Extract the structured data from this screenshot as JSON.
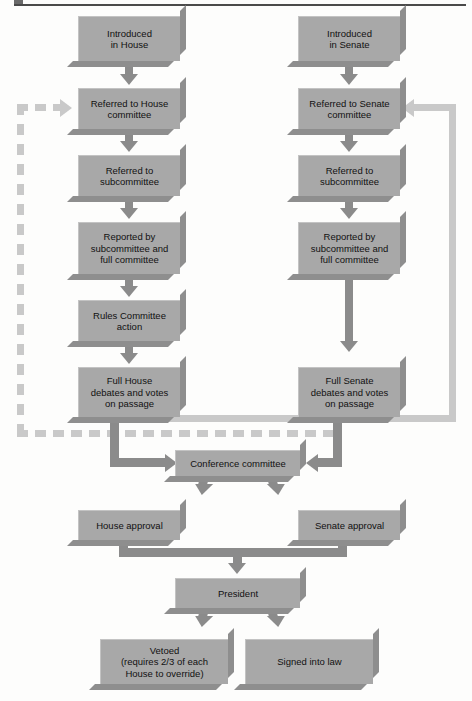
{
  "diagram": {
    "colors": {
      "box_fill": "#a8a8a8",
      "box_shadow": "#8e8e8e",
      "connector_dark": "#8b8b8b",
      "connector_light": "#c9c9c9",
      "rule": "#4a4a4a",
      "background": "#fdfdfc",
      "text": "#111111"
    },
    "nodes": {
      "introduced_house": "Introduced\nin House",
      "referred_house_committee": "Referred to House\ncommittee",
      "referred_house_subcommittee": "Referred to\nsubcommittee",
      "reported_house": "Reported by\nsubcommittee and\nfull committee",
      "rules_committee": "Rules Committee\naction",
      "full_house": "Full House\ndebates and votes\non passage",
      "introduced_senate": "Introduced\nin Senate",
      "referred_senate_committee": "Referred to Senate\ncommittee",
      "referred_senate_subcommittee": "Referred to\nsubcommittee",
      "reported_senate": "Reported by\nsubcommittee and\nfull committee",
      "full_senate": "Full Senate\ndebates and votes\non passage",
      "conference_committee": "Conference committee",
      "house_approval": "House approval",
      "senate_approval": "Senate approval",
      "president": "President",
      "vetoed": "Vetoed\n(requires 2/3 of each\nHouse to override)",
      "signed": "Signed into law"
    },
    "edges": [
      {
        "from": "introduced_house",
        "to": "referred_house_committee",
        "style": "solid-down"
      },
      {
        "from": "referred_house_committee",
        "to": "referred_house_subcommittee",
        "style": "solid-down"
      },
      {
        "from": "referred_house_subcommittee",
        "to": "reported_house",
        "style": "solid-down"
      },
      {
        "from": "reported_house",
        "to": "rules_committee",
        "style": "solid-down"
      },
      {
        "from": "rules_committee",
        "to": "full_house",
        "style": "solid-down"
      },
      {
        "from": "full_house",
        "to": "conference_committee",
        "style": "solid-elbow-right"
      },
      {
        "from": "introduced_senate",
        "to": "referred_senate_committee",
        "style": "solid-down"
      },
      {
        "from": "referred_senate_committee",
        "to": "referred_senate_subcommittee",
        "style": "solid-down"
      },
      {
        "from": "referred_senate_subcommittee",
        "to": "reported_senate",
        "style": "solid-down"
      },
      {
        "from": "reported_senate",
        "to": "full_senate",
        "style": "solid-down-long"
      },
      {
        "from": "full_senate",
        "to": "conference_committee",
        "style": "solid-elbow-left"
      },
      {
        "from": "full_house",
        "to": "referred_house_committee",
        "style": "dashed-feedback-left"
      },
      {
        "from": "full_senate",
        "to": "referred_senate_committee",
        "style": "light-feedback-right"
      },
      {
        "from": "conference_committee",
        "to": "house_approval",
        "style": "solid-down-diag"
      },
      {
        "from": "conference_committee",
        "to": "senate_approval",
        "style": "solid-down-diag"
      },
      {
        "from": "house_approval",
        "to": "president",
        "style": "solid-merge"
      },
      {
        "from": "senate_approval",
        "to": "president",
        "style": "solid-merge"
      },
      {
        "from": "president",
        "to": "vetoed",
        "style": "solid-down-diag"
      },
      {
        "from": "president",
        "to": "signed",
        "style": "solid-down-diag"
      }
    ]
  }
}
